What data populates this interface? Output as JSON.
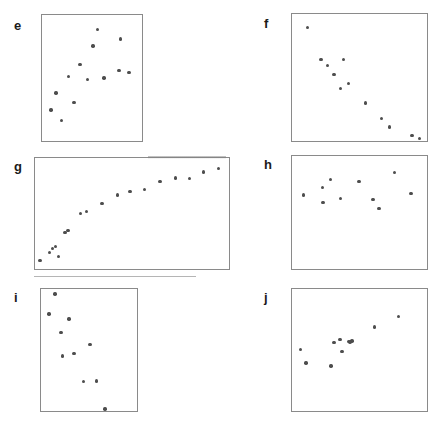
{
  "figure": {
    "title": "",
    "width": 445,
    "height": 425,
    "background": "#ffffff",
    "point_color": "#4d4d4d",
    "frame_color": "#8a8a8a",
    "label_color": "#1a1a1a"
  },
  "chart_data": [
    {
      "type": "scatter",
      "panel": "e",
      "label": "e",
      "title": "",
      "xlabel": "",
      "ylabel": "",
      "xlim": [
        0,
        1
      ],
      "ylim": [
        0,
        1
      ],
      "grid": false,
      "legend": "none",
      "pattern": "no correlation / weak positive scatter",
      "n_points": 13,
      "x": [
        0.555,
        0.785,
        0.51,
        0.87,
        0.38,
        0.265,
        0.455,
        0.62,
        0.14,
        0.32,
        0.09,
        0.195,
        0.77
      ],
      "y": [
        0.885,
        0.81,
        0.755,
        0.545,
        0.605,
        0.51,
        0.49,
        0.5,
        0.38,
        0.305,
        0.245,
        0.165,
        0.56
      ]
    },
    {
      "type": "scatter",
      "panel": "f",
      "label": "f",
      "title": "",
      "xlabel": "",
      "ylabel": "",
      "xlim": [
        0,
        1
      ],
      "ylim": [
        0,
        1
      ],
      "grid": false,
      "legend": "none",
      "pattern": "strong negative correlation",
      "n_points": 12,
      "x": [
        0.115,
        0.215,
        0.265,
        0.38,
        0.31,
        0.36,
        0.42,
        0.545,
        0.665,
        0.72,
        0.89,
        0.945
      ],
      "y": [
        0.895,
        0.64,
        0.595,
        0.64,
        0.525,
        0.415,
        0.455,
        0.3,
        0.175,
        0.11,
        0.045,
        0.02
      ]
    },
    {
      "type": "scatter",
      "panel": "g",
      "label": "g",
      "title": "",
      "xlabel": "",
      "ylabel": "",
      "xlim": [
        0,
        1
      ],
      "ylim": [
        0,
        1
      ],
      "grid": false,
      "legend": "none",
      "pattern": "logarithmic / saturating positive relationship",
      "n_points": 18,
      "x": [
        0.025,
        0.075,
        0.09,
        0.105,
        0.12,
        0.155,
        0.17,
        0.235,
        0.265,
        0.345,
        0.425,
        0.49,
        0.565,
        0.645,
        0.725,
        0.795,
        0.87,
        0.945
      ],
      "y": [
        0.075,
        0.15,
        0.185,
        0.205,
        0.11,
        0.33,
        0.345,
        0.5,
        0.52,
        0.59,
        0.665,
        0.7,
        0.715,
        0.79,
        0.82,
        0.815,
        0.875,
        0.905
      ]
    },
    {
      "type": "scatter",
      "panel": "h",
      "label": "h",
      "title": "",
      "xlabel": "",
      "ylabel": "",
      "xlim": [
        0,
        1
      ],
      "ylim": [
        0,
        1
      ],
      "grid": false,
      "legend": "none",
      "pattern": "no correlation, points clustered in upper band",
      "n_points": 10,
      "x": [
        0.085,
        0.225,
        0.285,
        0.23,
        0.36,
        0.495,
        0.6,
        0.645,
        0.76,
        0.88
      ],
      "y": [
        0.655,
        0.72,
        0.79,
        0.59,
        0.625,
        0.775,
        0.615,
        0.535,
        0.855,
        0.67
      ]
    },
    {
      "type": "scatter",
      "panel": "i",
      "label": "i",
      "title": "",
      "xlabel": "",
      "ylabel": "",
      "xlim": [
        0,
        1
      ],
      "ylim": [
        0,
        1
      ],
      "grid": false,
      "legend": "none",
      "pattern": "moderate negative correlation with outlier at bottom",
      "n_points": 10,
      "x": [
        0.145,
        0.085,
        0.29,
        0.21,
        0.51,
        0.345,
        0.225,
        0.44,
        0.58,
        0.665
      ],
      "y": [
        0.96,
        0.795,
        0.755,
        0.645,
        0.545,
        0.47,
        0.45,
        0.24,
        0.245,
        0.015
      ]
    },
    {
      "type": "scatter",
      "panel": "j",
      "label": "j",
      "title": "",
      "xlabel": "",
      "ylabel": "",
      "xlim": [
        0,
        1
      ],
      "ylim": [
        0,
        1
      ],
      "grid": false,
      "legend": "none",
      "pattern": "positive correlation with central cluster",
      "n_points": 11,
      "x": [
        0.79,
        0.61,
        0.355,
        0.31,
        0.42,
        0.445,
        0.37,
        0.065,
        0.105,
        0.29,
        0.43
      ],
      "y": [
        0.775,
        0.69,
        0.585,
        0.56,
        0.57,
        0.575,
        0.49,
        0.505,
        0.395,
        0.37,
        0.565
      ]
    }
  ],
  "panels": [
    {
      "label": "e",
      "label_x": 14,
      "label_y": 19,
      "x": 41,
      "y": 14,
      "width": 102,
      "height": 128
    },
    {
      "label": "f",
      "label_x": 264,
      "label_y": 17,
      "x": 291,
      "y": 13,
      "width": 137,
      "height": 129
    },
    {
      "label": "g",
      "label_x": 14,
      "label_y": 160,
      "x": 34,
      "y": 157,
      "width": 196,
      "height": 113
    },
    {
      "label": "h",
      "label_x": 264,
      "label_y": 158,
      "x": 291,
      "y": 155,
      "width": 137,
      "height": 115
    },
    {
      "label": "i",
      "label_x": 14,
      "label_y": 291,
      "x": 40,
      "y": 288,
      "width": 98,
      "height": 124
    },
    {
      "label": "j",
      "label_x": 264,
      "label_y": 291,
      "x": 291,
      "y": 288,
      "width": 137,
      "height": 124
    }
  ]
}
